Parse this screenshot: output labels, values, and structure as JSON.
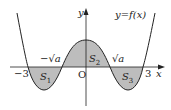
{
  "diagram": {
    "function_label": "y=f(x)",
    "axis_labels": {
      "x": "x",
      "y": "y",
      "origin": "O"
    },
    "x_ticks": [
      {
        "label": "−3",
        "value": -3
      },
      {
        "label": "−√a",
        "value": "-sqrt(a)"
      },
      {
        "label": "√a",
        "value": "sqrt(a)"
      },
      {
        "label": "3",
        "value": 3
      }
    ],
    "regions": [
      {
        "label": "S",
        "sub": "1",
        "interval": "[-3, -√a]",
        "position": "below x-axis"
      },
      {
        "label": "S",
        "sub": "2",
        "interval": "[-√a, √a]",
        "position": "above x-axis"
      },
      {
        "label": "S",
        "sub": "3",
        "interval": "[√a, 3]",
        "position": "below x-axis"
      }
    ],
    "colors": {
      "fill": "#bdbdbd",
      "stroke": "#222222",
      "axis": "#222222"
    }
  }
}
